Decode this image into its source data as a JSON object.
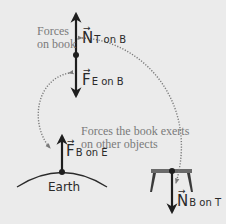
{
  "labels": {
    "forces_on_book_line1": "Forces",
    "forces_on_book_line2": "on book",
    "forces_exerted_line1": "Forces the book exerts",
    "forces_exerted_line2": "on other objects",
    "earth": "Earth"
  },
  "vectors": {
    "n_t_on_b": {
      "symbol": "N",
      "subscript": "T on B",
      "arrow": "→"
    },
    "f_e_on_b": {
      "symbol": "F",
      "subscript": "E on B",
      "arrow": "→"
    },
    "f_b_on_e": {
      "symbol": "F",
      "subscript": "B on E",
      "arrow": "→"
    },
    "n_b_on_t": {
      "symbol": "N",
      "subscript": "B on T",
      "arrow": "→"
    }
  },
  "colors": {
    "background": "#ebebeb",
    "arrow": "#1e1e1e",
    "dotted": "#7a7a7a",
    "caption": "#7a7a7a"
  }
}
